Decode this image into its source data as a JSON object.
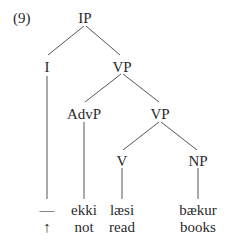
{
  "example_number": "(9)",
  "tree": {
    "nodes": {
      "IP": "IP",
      "I": "I",
      "VP_upper": "VP",
      "AdvP": "AdvP",
      "VP_lower": "VP",
      "V": "V",
      "NP": "NP"
    },
    "leaves": [
      {
        "parent": "I",
        "word": "—",
        "gloss": "↑"
      },
      {
        "parent": "AdvP",
        "word": "ekki",
        "gloss": "not"
      },
      {
        "parent": "V",
        "word": "læsi",
        "gloss": "read"
      },
      {
        "parent": "NP",
        "word": "bækur",
        "gloss": "books"
      }
    ],
    "edges": [
      [
        "IP",
        "I"
      ],
      [
        "IP",
        "VP_upper"
      ],
      [
        "VP_upper",
        "AdvP"
      ],
      [
        "VP_upper",
        "VP_lower"
      ],
      [
        "VP_lower",
        "V"
      ],
      [
        "VP_lower",
        "NP"
      ],
      [
        "I",
        "—"
      ],
      [
        "AdvP",
        "ekki"
      ],
      [
        "V",
        "læsi"
      ],
      [
        "NP",
        "bækur"
      ]
    ]
  },
  "colors": {
    "text": "#2a2a2a",
    "line": "#555555"
  }
}
